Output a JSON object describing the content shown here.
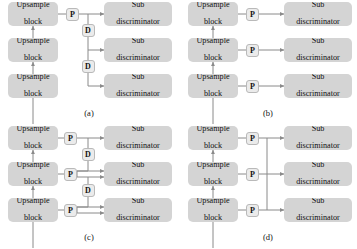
{
  "figure": {
    "background_color": "#ffffff",
    "box_fill_color": "#d4d4d4",
    "node_fill_color": "#ebebeb",
    "line_color": "#8a8a8a",
    "text_color": "#111111"
  },
  "labels": {
    "upsample_line1": "Upsample",
    "upsample_line2": "block",
    "sub_line1": "Sub",
    "sub_line2": "discriminator",
    "node_p": "P",
    "node_d": "D"
  },
  "panels": [
    {
      "id": "a",
      "caption": "(a)",
      "upsample_blocks": [
        "Upsample block",
        "Upsample block",
        "Upsample block"
      ],
      "sub_discriminators": [
        "Sub discriminator",
        "Sub discriminator",
        "Sub discriminator"
      ],
      "projection_nodes": [
        "P"
      ],
      "downsample_nodes": [
        "D",
        "D"
      ],
      "description": "Single P from top upsample block, chained through two D nodes down to the lower sub discriminators"
    },
    {
      "id": "b",
      "caption": "(b)",
      "upsample_blocks": [
        "Upsample block",
        "Upsample block",
        "Upsample block"
      ],
      "sub_discriminators": [
        "Sub discriminator",
        "Sub discriminator",
        "Sub discriminator"
      ],
      "projection_nodes": [
        "P",
        "P",
        "P"
      ],
      "downsample_nodes": [],
      "description": "Each upsample block has its own P feeding its own sub discriminator, fully parallel"
    },
    {
      "id": "c",
      "caption": "(c)",
      "upsample_blocks": [
        "Upsample block",
        "Upsample block",
        "Upsample block"
      ],
      "sub_discriminators": [
        "Sub discriminator",
        "Sub discriminator",
        "Sub discriminator"
      ],
      "projection_nodes": [
        "P",
        "P",
        "P"
      ],
      "downsample_nodes": [
        "D",
        "D"
      ],
      "description": "Each upsample block has a P, and D nodes chain downward so lower sub discriminators receive two inputs"
    },
    {
      "id": "d",
      "caption": "(d)",
      "upsample_blocks": [
        "Upsample block",
        "Upsample block",
        "Upsample block"
      ],
      "sub_discriminators": [
        "Sub discriminator",
        "Sub discriminator",
        "Sub discriminator"
      ],
      "projection_nodes": [
        "P",
        "P",
        "P"
      ],
      "downsample_nodes": [],
      "description": "Each upsample block has a P joined onto a shared vertical bus feeding every sub discriminator"
    }
  ]
}
